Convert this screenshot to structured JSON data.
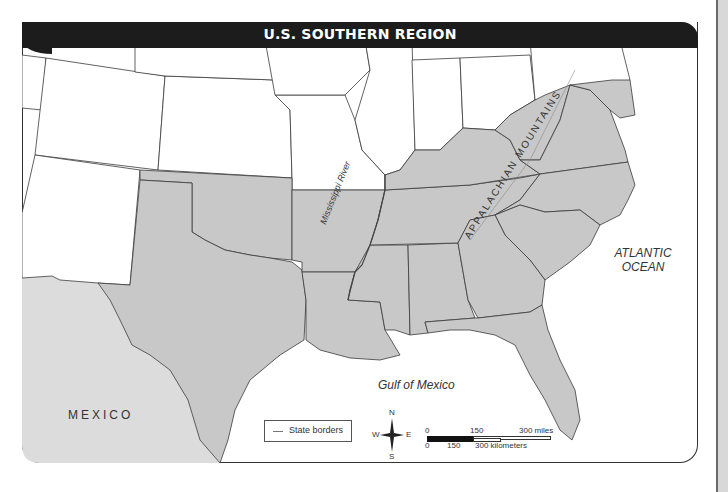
{
  "map": {
    "title": "U.S. SOUTHERN REGION",
    "labels": {
      "atlantic_line1": "ATLANTIC",
      "atlantic_line2": "OCEAN",
      "gulf": "Gulf of Mexico",
      "mexico": "MEXICO",
      "mississippi": "Mississippi River",
      "appalachian": "APPALACHIAN MOUNTAINS"
    },
    "legend": {
      "items": [
        {
          "symbol": "line",
          "label": "State borders"
        }
      ]
    },
    "compass": {
      "n": "N",
      "s": "S",
      "e": "E",
      "w": "W"
    },
    "scale": {
      "miles_ticks": [
        "0",
        "150",
        "300 miles"
      ],
      "km_ticks": [
        "0",
        "150",
        "300 kilometers"
      ]
    },
    "colors": {
      "southern_states": "#c8c8c8",
      "other_states": "#ffffff",
      "mexico": "#dcdcdc",
      "water": "#ffffff",
      "border": "#3a3a3a",
      "title_bar": "#1c1c1c"
    },
    "highlighted_region": "Southern states"
  }
}
